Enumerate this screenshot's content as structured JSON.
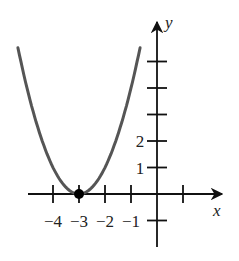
{
  "chart_data": {
    "type": "line",
    "title": "",
    "xlabel": "x",
    "ylabel": "y",
    "function": "y = (x + 3)^2",
    "x_ticks": [
      -4,
      -3,
      -2,
      -1,
      0,
      1
    ],
    "x_tick_labels": [
      "−4",
      "−3",
      "−2",
      "−1"
    ],
    "y_ticks": [
      -1,
      1,
      2,
      3,
      4,
      5
    ],
    "y_tick_labels": [
      "1",
      "2"
    ],
    "xlim": [
      -5.35,
      2.5
    ],
    "ylim": [
      -2,
      6.6
    ],
    "series": [
      {
        "name": "parabola",
        "x": [
          -5.35,
          -5,
          -4.5,
          -4,
          -3.5,
          -3,
          -2.5,
          -2,
          -1.5,
          -1,
          -0.65
        ],
        "y": [
          5.52,
          4,
          2.25,
          1,
          0.25,
          0,
          0.25,
          1,
          2.25,
          4,
          5.52
        ]
      }
    ],
    "annotations": [
      {
        "type": "point",
        "x": -3,
        "y": 0,
        "filled": true,
        "label": "vertex"
      }
    ],
    "grid": false,
    "colors": {
      "curve": "#555555",
      "axes": "#111111",
      "point": "#000000"
    }
  }
}
